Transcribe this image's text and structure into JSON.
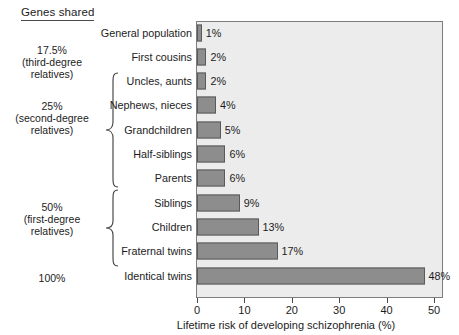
{
  "heading": "Genes shared",
  "groups": [
    {
      "text": "17.5%\n(third-degree\nrelatives)",
      "brace": false
    },
    {
      "text": "25%\n(second-degree\nrelatives)",
      "brace": true
    },
    {
      "text": "50%\n(first-degree\nrelatives)",
      "brace": true
    },
    {
      "text": "100%",
      "brace": false
    }
  ],
  "chart_data": {
    "type": "bar",
    "orientation": "horizontal",
    "title": "",
    "xlabel": "Lifetime risk of developing schizophrenia (%)",
    "ylabel": "",
    "xlim": [
      0,
      55
    ],
    "xticks": [
      0,
      10,
      20,
      30,
      40,
      50
    ],
    "xticklabels": [
      "0",
      "10",
      "20",
      "30",
      "40",
      "50"
    ],
    "grid": false,
    "legend": null,
    "categories": [
      "General population",
      "First cousins",
      "Uncles, aunts",
      "Nephews, nieces",
      "Grandchildren",
      "Half-siblings",
      "Parents",
      "Siblings",
      "Children",
      "Fraternal twins",
      "Identical twins"
    ],
    "values": [
      1,
      2,
      2,
      4,
      5,
      6,
      6,
      9,
      13,
      17,
      48
    ],
    "value_labels": [
      "1%",
      "2%",
      "2%",
      "4%",
      "5%",
      "6%",
      "6%",
      "9%",
      "13%",
      "17%",
      "48%"
    ],
    "bar_color": "#8d8d8d",
    "bar_edge_color": "#5a5a5a",
    "plot_background": "#ececec"
  }
}
